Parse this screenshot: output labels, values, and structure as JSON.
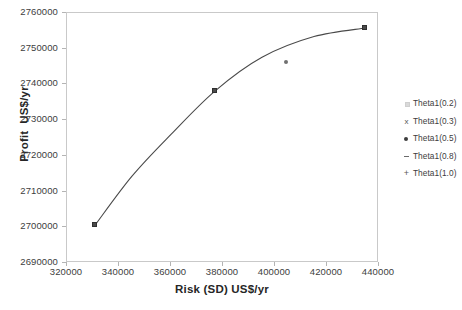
{
  "chart_data": {
    "type": "scatter",
    "title": "",
    "xlabel": "Risk (SD) US$/yr",
    "ylabel": "Profit  US$/yr",
    "xlim": [
      320000,
      440000
    ],
    "ylim": [
      2690000,
      2760000
    ],
    "xticks": [
      320000,
      340000,
      360000,
      380000,
      400000,
      420000,
      440000
    ],
    "yticks": [
      2690000,
      2700000,
      2710000,
      2720000,
      2730000,
      2740000,
      2750000,
      2760000
    ],
    "xtick_labels": [
      "320000",
      "340000",
      "360000",
      "380000",
      "400000",
      "420000",
      "440000"
    ],
    "ytick_labels": [
      "2690000",
      "2700000",
      "2710000",
      "2720000",
      "2730000",
      "2740000",
      "2750000",
      "2760000"
    ],
    "grid": false,
    "legend_position": "right",
    "curve_color": "#4a4a4a",
    "axis_color": "#c9c9c9",
    "points": [
      {
        "x": 330800,
        "y": 2700600,
        "marker": "square",
        "series": "Theta1(0.2)"
      },
      {
        "x": 377000,
        "y": 2738200,
        "marker": "square",
        "series": "Theta1(0.5)"
      },
      {
        "x": 404200,
        "y": 2746300,
        "marker": "dot",
        "series": "Theta1(0.8)"
      },
      {
        "x": 434600,
        "y": 2755800,
        "marker": "square",
        "series": "Theta1(1.0)"
      }
    ],
    "curve": [
      {
        "x": 330800,
        "y": 2700600
      },
      {
        "x": 345000,
        "y": 2714300
      },
      {
        "x": 360000,
        "y": 2726000
      },
      {
        "x": 377000,
        "y": 2738200
      },
      {
        "x": 395000,
        "y": 2747600
      },
      {
        "x": 415000,
        "y": 2753400
      },
      {
        "x": 434600,
        "y": 2755800
      }
    ],
    "series": [
      {
        "name": "Theta1(0.2)",
        "marker": "square"
      },
      {
        "name": "Theta1(0.3)",
        "marker": "cross"
      },
      {
        "name": "Theta1(0.5)",
        "marker": "dot"
      },
      {
        "name": "Theta1(0.8)",
        "marker": "dash"
      },
      {
        "name": "Theta1(1.0)",
        "marker": "plus"
      }
    ]
  },
  "legend": {
    "items": [
      {
        "label": "Theta1(0.2)",
        "glyph": "square-marker-icon"
      },
      {
        "label": "Theta1(0.3)",
        "glyph": "cross-marker-icon"
      },
      {
        "label": "Theta1(0.5)",
        "glyph": "dot-marker-icon"
      },
      {
        "label": "Theta1(0.8)",
        "glyph": "dash-marker-icon"
      },
      {
        "label": "Theta1(1.0)",
        "glyph": "plus-marker-icon"
      }
    ]
  },
  "glyph_chars": {
    "cross": "x",
    "plus": "+"
  }
}
